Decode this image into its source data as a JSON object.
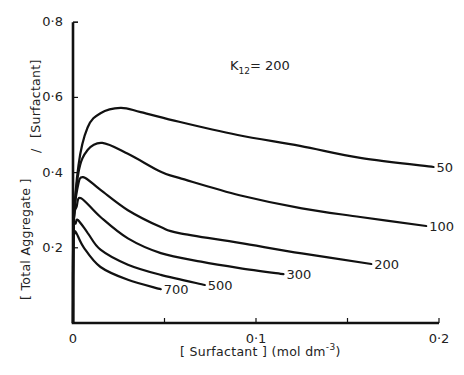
{
  "chart_data": {
    "type": "line",
    "title": "",
    "annotation": {
      "prefix": "K",
      "subscript": "12",
      "suffix": "= 200"
    },
    "xlabel": {
      "text": "[ Surfactant ] (mol dm",
      "superscript": "-3",
      "close": ")"
    },
    "ylabel": {
      "main": "[ Total Aggregate ]",
      "slash": "/",
      "denominator": "[Surfactant]"
    },
    "xlim": [
      0,
      0.2
    ],
    "ylim": [
      0,
      0.8
    ],
    "x_ticks": [
      {
        "value": 0,
        "label": "0"
      },
      {
        "value": 0.05,
        "label": ""
      },
      {
        "value": 0.1,
        "label": "0·1"
      },
      {
        "value": 0.15,
        "label": ""
      },
      {
        "value": 0.2,
        "label": "0·2"
      }
    ],
    "y_ticks": [
      {
        "value": 0.2,
        "label": "0·2"
      },
      {
        "value": 0.4,
        "label": "0·4"
      },
      {
        "value": 0.6,
        "label": "0·6"
      },
      {
        "value": 0.8,
        "label": "0·8"
      }
    ],
    "grid": false,
    "legend": "inline curve-end labels",
    "series": [
      {
        "name": "50",
        "x": [
          0.0003,
          0.003,
          0.008,
          0.015,
          0.026,
          0.037,
          0.058,
          0.09,
          0.124,
          0.157,
          0.197
        ],
        "y": [
          0.25,
          0.42,
          0.52,
          0.558,
          0.572,
          0.561,
          0.535,
          0.5,
          0.471,
          0.439,
          0.415
        ]
      },
      {
        "name": "100",
        "x": [
          0.0003,
          0.003,
          0.008,
          0.016,
          0.03,
          0.048,
          0.058,
          0.091,
          0.125,
          0.157,
          0.193
        ],
        "y": [
          0.25,
          0.4,
          0.46,
          0.479,
          0.45,
          0.402,
          0.386,
          0.34,
          0.305,
          0.282,
          0.258
        ]
      },
      {
        "name": "200",
        "x": [
          0.0003,
          0.0025,
          0.0055,
          0.015,
          0.03,
          0.048,
          0.058,
          0.091,
          0.125,
          0.163
        ],
        "y": [
          0.26,
          0.36,
          0.388,
          0.354,
          0.3,
          0.255,
          0.239,
          0.213,
          0.185,
          0.157
        ]
      },
      {
        "name": "300",
        "x": [
          0.0003,
          0.002,
          0.0044,
          0.015,
          0.03,
          0.048,
          0.07,
          0.091,
          0.115
        ],
        "y": [
          0.26,
          0.31,
          0.332,
          0.282,
          0.225,
          0.186,
          0.163,
          0.146,
          0.13
        ]
      },
      {
        "name": "500",
        "x": [
          0.0003,
          0.0015,
          0.0027,
          0.008,
          0.015,
          0.03,
          0.048,
          0.072
        ],
        "y": [
          0.24,
          0.265,
          0.274,
          0.24,
          0.195,
          0.155,
          0.128,
          0.101
        ]
      },
      {
        "name": "700",
        "x": [
          0.0003,
          0.001,
          0.0016,
          0.006,
          0.015,
          0.03,
          0.048
        ],
        "y": [
          0.22,
          0.238,
          0.242,
          0.2,
          0.149,
          0.115,
          0.09
        ]
      }
    ]
  }
}
